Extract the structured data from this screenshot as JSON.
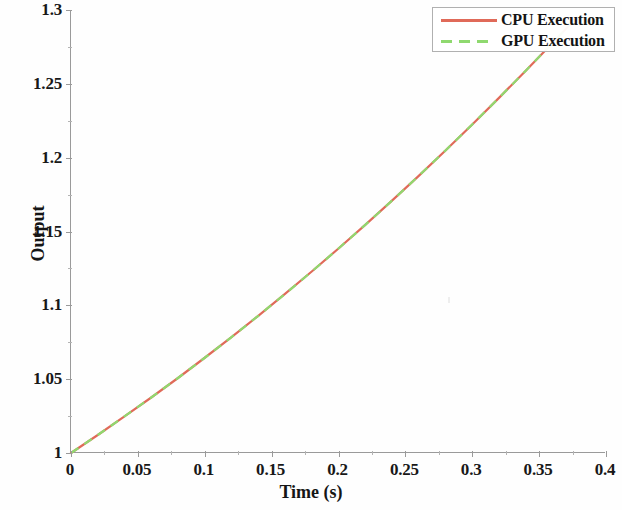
{
  "chart_data": {
    "type": "line",
    "title": "",
    "xlabel": "Time (s)",
    "ylabel": "Output",
    "xlim": [
      0,
      0.4
    ],
    "ylim": [
      1,
      1.3
    ],
    "xticks": [
      "0",
      "0.05",
      "0.1",
      "0.15",
      "0.2",
      "0.25",
      "0.3",
      "0.35",
      "0.4"
    ],
    "xtick_values": [
      0,
      0.05,
      0.1,
      0.15,
      0.2,
      0.25,
      0.3,
      0.35,
      0.4
    ],
    "yticks": [
      "1",
      "1.05",
      "1.1",
      "1.15",
      "1.2",
      "1.25",
      "1.3"
    ],
    "ytick_values": [
      1,
      1.05,
      1.1,
      1.15,
      1.2,
      1.25,
      1.3
    ],
    "grid": false,
    "legend_position": "top-right",
    "x": [
      0,
      0.02,
      0.04,
      0.06,
      0.08,
      0.1,
      0.12,
      0.14,
      0.16,
      0.18,
      0.2,
      0.22,
      0.24,
      0.26,
      0.28,
      0.3,
      0.32,
      0.34,
      0.36,
      0.378
    ],
    "series": [
      {
        "name": "CPU Execution",
        "color": "#e06a59",
        "style": "solid",
        "width": 2.2,
        "values": [
          1.0,
          1.0122,
          1.0248,
          1.0376,
          1.0508,
          1.0645,
          1.0785,
          1.0929,
          1.1077,
          1.1229,
          1.1385,
          1.1545,
          1.1709,
          1.1877,
          1.2049,
          1.2225,
          1.2405,
          1.2589,
          1.2777,
          1.2949
        ]
      },
      {
        "name": "GPU Execution",
        "color": "#8fd96f",
        "style": "dashed",
        "width": 2.2,
        "values": [
          1.0,
          1.0122,
          1.0248,
          1.0376,
          1.0508,
          1.0645,
          1.0785,
          1.0929,
          1.1077,
          1.1229,
          1.1385,
          1.1545,
          1.1709,
          1.1877,
          1.2049,
          1.2225,
          1.2405,
          1.2589,
          1.2777,
          1.2949
        ]
      }
    ]
  },
  "legend": {
    "entries": [
      {
        "label": "CPU Execution"
      },
      {
        "label": "GPU Execution"
      }
    ]
  },
  "axes": {
    "x_title": "Time (s)",
    "y_title": "Output"
  }
}
